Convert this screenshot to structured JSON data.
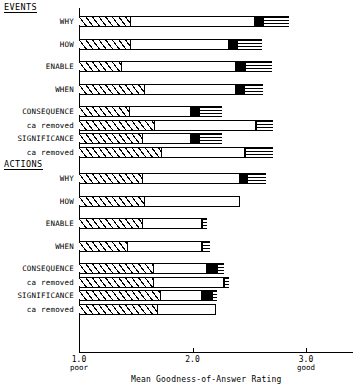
{
  "chart_data": {
    "type": "bar",
    "orientation": "horizontal",
    "stacked": true,
    "title": "",
    "xlabel": "Mean Goodness-of-Answer Rating",
    "ylabel": "",
    "xlim": [
      1.0,
      3.2
    ],
    "xticks": [
      {
        "value": 1.0,
        "label": "1.0",
        "qualifier": "poor"
      },
      {
        "value": 2.0,
        "label": "2.0",
        "qualifier": ""
      },
      {
        "value": 3.0,
        "label": "3.0",
        "qualifier": "good"
      }
    ],
    "grid": false,
    "legend": "none",
    "segment_types": [
      "hatched",
      "white",
      "solid-black",
      "horizontal-lines"
    ],
    "groups": [
      {
        "name": "EVENTS",
        "rows": [
          {
            "label": "WHY",
            "sublabel": "",
            "hatch_end": 1.46,
            "white_end": 2.55,
            "black_end": 2.62,
            "lines_end": 2.85
          },
          {
            "label": "HOW",
            "sublabel": "",
            "hatch_end": 1.46,
            "white_end": 2.32,
            "black_end": 2.39,
            "lines_end": 2.61
          },
          {
            "label": "ENABLE",
            "sublabel": "",
            "hatch_end": 1.38,
            "white_end": 2.38,
            "black_end": 2.46,
            "lines_end": 2.7
          },
          {
            "label": "WHEN",
            "sublabel": "",
            "hatch_end": 1.58,
            "white_end": 2.38,
            "black_end": 2.45,
            "lines_end": 2.62
          },
          {
            "label": "CONSEQUENCE",
            "sublabel": "",
            "hatch_end": 1.45,
            "white_end": 1.99,
            "black_end": 2.06,
            "lines_end": 2.26
          },
          {
            "label": "",
            "sublabel": "ca removed",
            "hatch_end": 1.67,
            "white_end": 2.56,
            "black_end": 2.56,
            "lines_end": 2.71
          },
          {
            "label": "SIGNIFICANCE",
            "sublabel": "",
            "hatch_end": 1.56,
            "white_end": 1.99,
            "black_end": 2.06,
            "lines_end": 2.26
          },
          {
            "label": "",
            "sublabel": "ca removed",
            "hatch_end": 1.73,
            "white_end": 2.46,
            "black_end": 2.46,
            "lines_end": 2.71
          }
        ]
      },
      {
        "name": "ACTIONS",
        "rows": [
          {
            "label": "WHY",
            "sublabel": "",
            "hatch_end": 1.56,
            "white_end": 2.42,
            "black_end": 2.48,
            "lines_end": 2.65
          },
          {
            "label": "HOW",
            "sublabel": "",
            "hatch_end": 1.58,
            "white_end": 2.42,
            "black_end": 2.42,
            "lines_end": 2.42
          },
          {
            "label": "ENABLE",
            "sublabel": "",
            "hatch_end": 1.56,
            "white_end": 2.08,
            "black_end": 2.08,
            "lines_end": 2.13
          },
          {
            "label": "WHEN",
            "sublabel": "",
            "hatch_end": 1.43,
            "white_end": 2.08,
            "black_end": 2.08,
            "lines_end": 2.15
          },
          {
            "label": "CONSEQUENCE",
            "sublabel": "",
            "hatch_end": 1.66,
            "white_end": 2.13,
            "black_end": 2.22,
            "lines_end": 2.28
          },
          {
            "label": "",
            "sublabel": "ca removed",
            "hatch_end": 1.66,
            "white_end": 2.28,
            "black_end": 2.28,
            "lines_end": 2.32
          },
          {
            "label": "SIGNIFICANCE",
            "sublabel": "",
            "hatch_end": 1.72,
            "white_end": 2.08,
            "black_end": 2.17,
            "lines_end": 2.22
          },
          {
            "label": "",
            "sublabel": "ca removed",
            "hatch_end": 1.7,
            "white_end": 2.21,
            "black_end": 2.21,
            "lines_end": 2.21
          }
        ]
      }
    ]
  }
}
